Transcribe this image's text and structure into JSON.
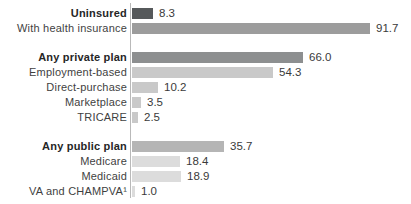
{
  "chart_data": {
    "type": "bar",
    "orientation": "horizontal",
    "title": "",
    "xlabel": "",
    "ylabel": "",
    "xlim": [
      0,
      100
    ],
    "grid": false,
    "units": "percent",
    "categories": [
      "Uninsured",
      "With health insurance",
      "Any private plan",
      "Employment-based",
      "Direct-purchase",
      "Marketplace",
      "TRICARE",
      "Any public plan",
      "Medicare",
      "Medicaid",
      "VA and CHAMPVA¹"
    ],
    "values": [
      8.3,
      91.7,
      66.0,
      54.3,
      10.2,
      3.5,
      2.5,
      35.7,
      18.4,
      18.9,
      1.0
    ],
    "rows": [
      {
        "label": "Uninsured",
        "value": 8.3,
        "display": "8.3",
        "bold": true,
        "color": "#56595b",
        "new_group": false
      },
      {
        "label": "With health insurance",
        "value": 91.7,
        "display": "91.7",
        "bold": false,
        "color": "#9c9c9c",
        "new_group": false
      },
      {
        "label": "Any private plan",
        "value": 66.0,
        "display": "66.0",
        "bold": true,
        "color": "#8d8f90",
        "new_group": true
      },
      {
        "label": "Employment-based",
        "value": 54.3,
        "display": "54.3",
        "bold": false,
        "color": "#c9c9c9",
        "new_group": false
      },
      {
        "label": "Direct-purchase",
        "value": 10.2,
        "display": "10.2",
        "bold": false,
        "color": "#c9c9c9",
        "new_group": false
      },
      {
        "label": "Marketplace",
        "value": 3.5,
        "display": "3.5",
        "bold": false,
        "color": "#c9c9c9",
        "new_group": false
      },
      {
        "label": "TRICARE",
        "value": 2.5,
        "display": "2.5",
        "bold": false,
        "color": "#c9c9c9",
        "new_group": false
      },
      {
        "label": "Any public plan",
        "value": 35.7,
        "display": "35.7",
        "bold": true,
        "color": "#b5b5b5",
        "new_group": true
      },
      {
        "label": "Medicare",
        "value": 18.4,
        "display": "18.4",
        "bold": false,
        "color": "#dcdcdc",
        "new_group": false
      },
      {
        "label": "Medicaid",
        "value": 18.9,
        "display": "18.9",
        "bold": false,
        "color": "#dcdcdc",
        "new_group": false
      },
      {
        "label": "VA and CHAMPVA¹",
        "value": 1.0,
        "display": "1.0",
        "bold": false,
        "color": "#dcdcdc",
        "new_group": false
      }
    ],
    "colors": {
      "dark_bar": "#56595b",
      "medium_bar": "#9c9c9c",
      "private_header_bar": "#8d8f90",
      "private_sub_bar": "#c9c9c9",
      "public_header_bar": "#b5b5b5",
      "public_sub_bar": "#dcdcdc",
      "axis_line": "#b9b9b9",
      "label_text": "#3f3f3f",
      "bold_label_text": "#262626",
      "value_text": "#3a3a3a",
      "background": "#ffffff"
    },
    "layout": {
      "width": 411,
      "height": 204,
      "label_right_edge": 127,
      "axis_x": 130,
      "bar_start_x": 132,
      "first_row_y": 8,
      "row_pitch": 15,
      "group_gap": 14,
      "bar_height": 11,
      "px_per_unit": 2.59,
      "value_gap": 6,
      "axis_top": 3,
      "axis_bottom": 198,
      "legend": "none"
    }
  }
}
